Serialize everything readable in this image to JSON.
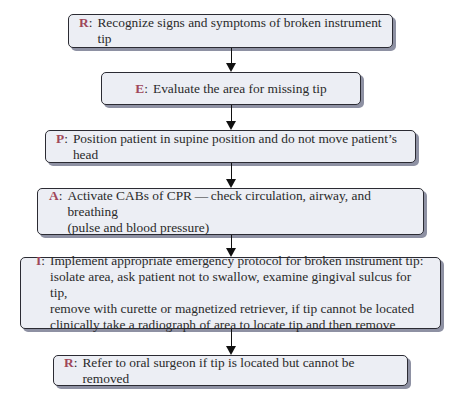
{
  "diagram": {
    "type": "flowchart",
    "acronym": "REPAIR",
    "steps": [
      {
        "letter": "R",
        "text": "Recognize signs and symptoms of broken instrument tip"
      },
      {
        "letter": "E",
        "text": "Evaluate the area for missing tip"
      },
      {
        "letter": "P",
        "text": "Position patient in supine position and do not move patient’s head"
      },
      {
        "letter": "A",
        "text": "Activate CABs of CPR — check circulation, airway, and breathing\n(pulse and blood pressure)"
      },
      {
        "letter": "I",
        "text": "Implement appropriate emergency protocol for broken instrument tip:\nisolate area, ask patient not to swallow, examine gingival sulcus for tip,\nremove with curette or magnetized retriever, if tip cannot be located\nclinically take a radiograph of area to locate tip and then remove"
      },
      {
        "letter": "R",
        "text": "Refer to oral surgeon if tip is located but cannot be removed"
      }
    ],
    "colors": {
      "letter": "#a0475a",
      "box_fill": "#eceef4",
      "box_border": "#2b2b33",
      "shadow": "#8e91a3",
      "arrow": "#111111"
    }
  }
}
